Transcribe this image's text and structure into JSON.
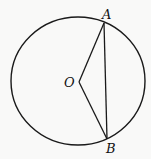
{
  "diagram": {
    "type": "circle-geometry",
    "circle": {
      "cx": 78,
      "cy": 81,
      "rx": 67,
      "ry": 64
    },
    "points": {
      "O": {
        "label": "O",
        "x": 79,
        "y": 82,
        "label_x": 64,
        "label_y": 87
      },
      "A": {
        "label": "A",
        "x": 104,
        "y": 23,
        "label_x": 102,
        "label_y": 19
      },
      "B": {
        "label": "B",
        "x": 107,
        "y": 139,
        "label_x": 106,
        "label_y": 153
      }
    },
    "segments": [
      {
        "from": "O",
        "to": "A"
      },
      {
        "from": "O",
        "to": "B"
      },
      {
        "from": "A",
        "to": "B"
      }
    ],
    "stroke_color": "#1a1a1a"
  }
}
